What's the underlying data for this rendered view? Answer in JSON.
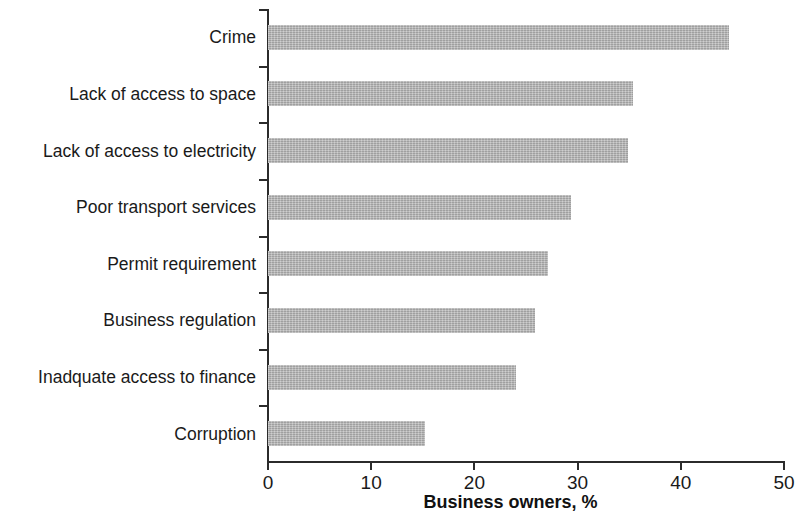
{
  "chart_data": {
    "type": "bar",
    "orientation": "horizontal",
    "title": "",
    "xlabel": "Business owners, %",
    "ylabel": "",
    "xlim": [
      0,
      50
    ],
    "xticks": [
      0,
      10,
      20,
      30,
      40,
      50
    ],
    "xtick_labels": [
      "0",
      "10",
      "20",
      "30",
      "40",
      "50"
    ],
    "grid": false,
    "legend": null,
    "bar_color": "#b3b3b3",
    "axis_color": "#2b2b2b",
    "text_color": "#1a1a1a",
    "categories": [
      "Crime",
      "Lack of access to space",
      "Lack of access to electricity",
      "Poor transport services",
      "Permit requirement",
      "Business regulation",
      "Inadquate access to finance",
      "Corruption"
    ],
    "values": [
      44.7,
      35.4,
      34.9,
      29.4,
      27.1,
      25.9,
      24.0,
      15.2
    ]
  },
  "axis": {
    "title": "Business owners, %"
  }
}
